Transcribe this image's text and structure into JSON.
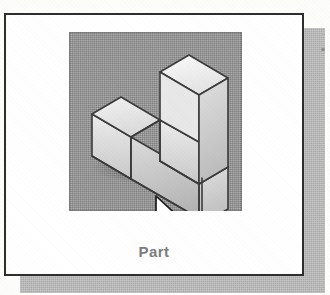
{
  "figure": {
    "kind": "new-document-template-tile",
    "caption": "Part",
    "caption_color": "#7d7d7d"
  },
  "card": {
    "background": "#ffffff",
    "border_color": "#2e2e2e",
    "shadow_color": "#a9a9a9"
  },
  "thumbnail": {
    "name": "part-preview",
    "background": "#8f8f8f",
    "model": {
      "name": "stepped-l-block",
      "projection": "isometric",
      "outline_color": "#3b3b3b",
      "faces": {
        "top_light": "#f2f2f2",
        "top_mid": "#e4e4e4",
        "left": "#dcdcdc",
        "right": "#c2c2c2",
        "front": "#d2d2d2"
      }
    }
  },
  "cursor": {
    "name": "mouse-pointer",
    "fill": "#ffffff",
    "outline": "#1a1a1a",
    "x": 152,
    "y": 180
  }
}
